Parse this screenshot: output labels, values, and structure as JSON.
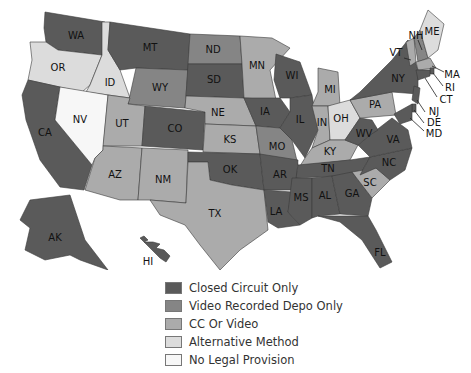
{
  "categories": {
    "closed": {
      "label": "Closed Circuit Only",
      "color": "#5a5a5a"
    },
    "video": {
      "label": "Video Recorded Depo Only",
      "color": "#858585"
    },
    "ccvideo": {
      "label": "CC Or Video",
      "color": "#ababab"
    },
    "alt": {
      "label": "Alternative Method",
      "color": "#dcdcdc"
    },
    "none": {
      "label": "No Legal Provision",
      "color": "#f7f7f7"
    }
  },
  "legend": [
    {
      "key": "closed",
      "label": "Closed Circuit Only"
    },
    {
      "key": "video",
      "label": "Video Recorded Depo Only"
    },
    {
      "key": "ccvideo",
      "label": "CC Or Video"
    },
    {
      "key": "alt",
      "label": "Alternative Method"
    },
    {
      "key": "none",
      "label": "No Legal Provision"
    }
  ],
  "states": {
    "WA": "closed",
    "OR": "alt",
    "CA": "closed",
    "ID": "alt",
    "NV": "none",
    "MT": "closed",
    "WY": "video",
    "UT": "ccvideo",
    "AZ": "ccvideo",
    "CO": "closed",
    "NM": "ccvideo",
    "ND": "video",
    "SD": "closed",
    "NE": "ccvideo",
    "KS": "ccvideo",
    "OK": "closed",
    "TX": "ccvideo",
    "MN": "ccvideo",
    "IA": "closed",
    "MO": "video",
    "AR": "closed",
    "LA": "closed",
    "WI": "closed",
    "IL": "closed",
    "MI": "ccvideo",
    "IN": "ccvideo",
    "OH": "alt",
    "KY": "ccvideo",
    "TN": "closed",
    "MS": "closed",
    "AL": "closed",
    "GA": "closed",
    "FL": "closed",
    "SC": "ccvideo",
    "NC": "closed",
    "VA": "closed",
    "WV": "closed",
    "PA": "ccvideo",
    "NY": "closed",
    "VT": "ccvideo",
    "NH": "video",
    "ME": "alt",
    "MA": "ccvideo",
    "RI": "closed",
    "CT": "closed",
    "NJ": "closed",
    "DE": "closed",
    "MD": "closed",
    "AK": "closed",
    "HI": "closed"
  }
}
